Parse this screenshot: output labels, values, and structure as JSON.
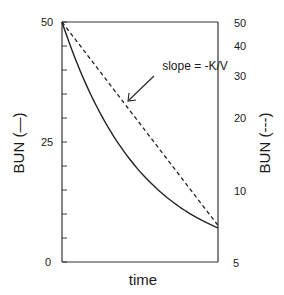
{
  "chart_data": {
    "type": "line",
    "title": "",
    "xlabel": "time",
    "ylabel_left": "BUN (—)",
    "ylabel_right": "BUN (---)",
    "left_axis": {
      "scale": "linear",
      "ylim": [
        0,
        50
      ],
      "tick_labels": [
        "0",
        "25",
        "50"
      ],
      "ticks": [
        0,
        25,
        50
      ],
      "minor_ticks": [
        5,
        10,
        15,
        20,
        30,
        35,
        40,
        45
      ]
    },
    "right_axis": {
      "scale": "log",
      "ylim": [
        5,
        50
      ],
      "tick_labels": [
        "5",
        "10",
        "20",
        "30",
        "40",
        "50"
      ],
      "ticks": [
        5,
        10,
        20,
        30,
        40,
        50
      ]
    },
    "x_axis": {
      "tick_labels": [],
      "range": [
        0,
        1
      ]
    },
    "grid": false,
    "series": [
      {
        "name": "BUN (linear scale)",
        "style": "solid",
        "axis": "left",
        "x": [
          0,
          0.1,
          0.2,
          0.3,
          0.4,
          0.5,
          0.6,
          0.7,
          0.8,
          0.9,
          1.0
        ],
        "values": [
          50,
          41.1,
          33.8,
          27.8,
          22.9,
          18.8,
          15.5,
          12.7,
          10.5,
          8.6,
          7.1
        ]
      },
      {
        "name": "BUN (log scale)",
        "style": "dashed",
        "axis": "right",
        "x": [
          0,
          1.0
        ],
        "values": [
          50,
          7.1
        ]
      }
    ],
    "annotations": [
      {
        "text": "slope = -K/V",
        "arrow_to": "dashed line"
      }
    ],
    "legend": null
  },
  "labels": {
    "left_ticks": [
      "50",
      "25",
      "0"
    ],
    "right_ticks": [
      "50",
      "40",
      "30",
      "20",
      "10",
      "5"
    ],
    "xlabel": "time",
    "ylabel_left": "BUN (—)",
    "ylabel_right": "BUN (---)",
    "annotation": "slope = -K/V"
  }
}
